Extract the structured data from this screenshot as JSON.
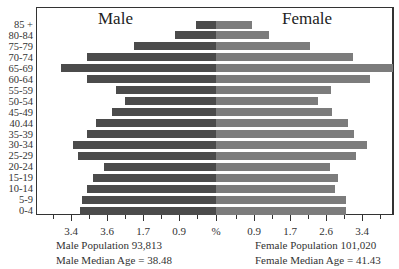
{
  "chart_data": {
    "type": "bar",
    "subtype": "population-pyramid",
    "title": "",
    "left_title": "Male",
    "right_title": "Female",
    "categories": [
      "85 +",
      "80-84",
      "75-79",
      "70-74",
      "65-69",
      "60-64",
      "55-59",
      "50-54",
      "45-49",
      "40.44",
      "35-39",
      "30-34",
      "25-29",
      "20-24",
      "15-19",
      "10-14",
      "5-9",
      "0-4"
    ],
    "series": [
      {
        "name": "Male",
        "color": "#4b4b4b",
        "values": [
          0.5,
          1.0,
          2.0,
          3.1,
          3.8,
          3.1,
          2.4,
          2.2,
          2.5,
          2.9,
          3.1,
          3.4,
          3.3,
          2.7,
          3.0,
          3.1,
          3.2,
          3.3
        ],
        "left_edge_px": [
          196,
          175,
          134,
          87,
          61,
          87,
          116,
          125,
          112,
          96,
          87,
          73,
          78,
          104,
          93,
          87,
          82,
          80
        ]
      },
      {
        "name": "Female",
        "color": "#7c7c7c",
        "values": [
          0.9,
          1.3,
          2.3,
          3.3,
          4.3,
          3.7,
          2.8,
          2.5,
          2.8,
          3.1,
          3.3,
          3.6,
          3.3,
          2.7,
          2.9,
          2.8,
          3.1,
          3.1
        ],
        "right_edge_px": [
          252,
          269,
          310,
          353,
          395,
          370,
          331,
          318,
          332,
          348,
          354,
          367,
          356,
          330,
          338,
          335,
          346,
          346
        ]
      }
    ],
    "x_ticks_left": [
      "3.4",
      "3.6",
      "1.7",
      "0.9"
    ],
    "x_ticks_right": [
      "0.9",
      "1.7",
      "2.6",
      "3.4"
    ],
    "x_center_label": "%",
    "xlabel": "%",
    "ylabel": "",
    "grid": false,
    "legend": "none"
  },
  "summary": {
    "male_population": "Male Population  93,813",
    "male_median": "Male Median Age = 38.48",
    "female_population": "Female Population  101,020",
    "female_median": "Female Median Age = 41.43"
  }
}
